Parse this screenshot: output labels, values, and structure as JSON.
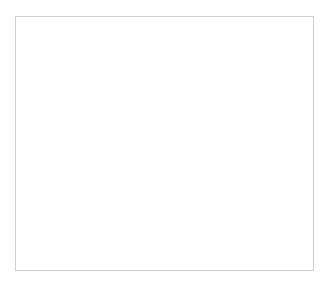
{
  "chart_data": {
    "type": "bar3d",
    "title": "",
    "ylabel": "ind",
    "xlabel": "",
    "zlabel": "",
    "ylim": [
      0,
      100000
    ],
    "yticks": [
      "0",
      "20000",
      "40000",
      "60000",
      "80000",
      "100000"
    ],
    "categories": [
      "1955",
      "1960",
      "1965",
      "1970",
      "1975",
      "1980",
      "1984",
      "1992",
      "1994",
      "1998",
      "1999",
      "2001"
    ],
    "rows": [
      "1",
      "2",
      "3",
      "4",
      "5"
    ],
    "grid": true,
    "series": [
      {
        "name": "1",
        "color": "#8c8c8c",
        "values": [
          null,
          110000,
          null,
          null,
          null,
          null,
          65000,
          null,
          25000,
          null,
          null,
          null
        ]
      },
      {
        "name": "2",
        "color": "#b4b4b4",
        "values": [
          null,
          null,
          null,
          null,
          null,
          null,
          null,
          null,
          null,
          95000,
          78000,
          32000
        ]
      },
      {
        "name": "3",
        "color": "#4a4a4a",
        "values": [
          null,
          100000,
          null,
          null,
          null,
          30000,
          null,
          20000,
          null,
          18000,
          15000,
          null
        ]
      },
      {
        "name": "4",
        "color": "#e8e8e8",
        "values": [
          null,
          null,
          null,
          null,
          70000,
          62000,
          42000,
          33000,
          20000,
          12000,
          null,
          null
        ]
      },
      {
        "name": "5",
        "color": "#c8c8c8",
        "values": [
          100000,
          null,
          null,
          45000,
          null,
          18000,
          3000,
          null,
          null,
          null,
          null,
          null
        ]
      }
    ]
  },
  "axis": {
    "y_title": "ind",
    "yticks": [
      "0",
      "20000",
      "40000",
      "60000",
      "80000",
      "100000"
    ],
    "xticks": [
      "1955",
      "1960",
      "1965",
      "1970",
      "1975",
      "1980",
      "1984",
      "1992",
      "1994",
      "1998",
      "1999",
      "2001"
    ],
    "zticks": [
      "1",
      "2",
      "3",
      "4",
      "5"
    ]
  },
  "colors": {
    "wall": "#a0a0a0",
    "floor_edge": "#b0b0b0",
    "grid": "#e0e0e0",
    "frame": "#cfcfcf"
  }
}
